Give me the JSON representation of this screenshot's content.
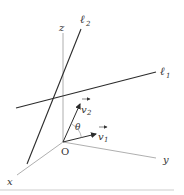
{
  "diagram": {
    "type": "3d-coordinate-lines",
    "colors": {
      "axis": "#9a9a9a",
      "line": "#2b2b2b",
      "text": "#333333",
      "footer": "#e6e6e6"
    },
    "axes": {
      "x": {
        "label": "x"
      },
      "y": {
        "label": "y"
      },
      "z": {
        "label": "z"
      },
      "origin": {
        "label": "O"
      }
    },
    "lines": [
      {
        "id": "l1",
        "label": "ℓ",
        "subscript": "1"
      },
      {
        "id": "l2",
        "label": "ℓ",
        "subscript": "2"
      }
    ],
    "vectors": [
      {
        "id": "v1",
        "label": "v",
        "subscript": "1"
      },
      {
        "id": "v2",
        "label": "v",
        "subscript": "2"
      }
    ],
    "angle": {
      "label": "θ"
    }
  }
}
